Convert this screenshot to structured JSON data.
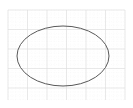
{
  "canvas": {
    "width": 133,
    "height": 108,
    "background_color": "#ffffff",
    "name": "drawing-canvas"
  },
  "grid": {
    "visible": true,
    "origin_x": 8,
    "origin_y": 10,
    "end_x": 125,
    "end_y": 100,
    "major_spacing": 19.5,
    "minor_spacing": 3.9,
    "major_color": "#e0e0e0",
    "minor_color": "#f0f0f0",
    "major_width": 0.7,
    "minor_width": 0.4,
    "minor_dash": "0.8 1.6"
  },
  "shapes": [
    {
      "type": "ellipse",
      "name": "ellipse-outline",
      "center_x": 63,
      "center_y": 56,
      "radius_x": 46,
      "radius_y": 30,
      "stroke_color": "#595959",
      "stroke_width": 1,
      "fill": "none"
    }
  ]
}
